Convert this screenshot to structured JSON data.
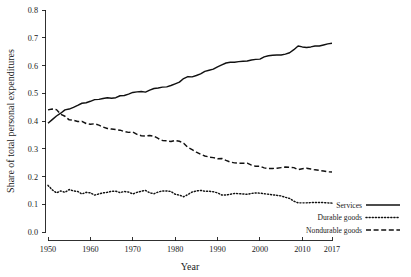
{
  "chart_data": {
    "type": "line",
    "title": "",
    "xlabel": "Year",
    "ylabel": "Share of total personal expenditures",
    "xlim": [
      1950,
      2017
    ],
    "ylim": [
      0.0,
      0.8
    ],
    "grid": false,
    "legend_position": "bottom-right",
    "xticks": [
      "1950",
      "1960",
      "1970",
      "1980",
      "1990",
      "2000",
      "2010",
      "2017"
    ],
    "xtick_values": [
      1950,
      1960,
      1970,
      1980,
      1990,
      2000,
      2010,
      2017
    ],
    "yticks": [
      "0.0",
      "0.1",
      "0.2",
      "0.3",
      "0.4",
      "0.5",
      "0.6",
      "0.7",
      "0.8"
    ],
    "ytick_values": [
      0.0,
      0.1,
      0.2,
      0.3,
      0.4,
      0.5,
      0.6,
      0.7,
      0.8
    ],
    "x": [
      1950,
      1951,
      1952,
      1953,
      1954,
      1955,
      1956,
      1957,
      1958,
      1959,
      1960,
      1961,
      1962,
      1963,
      1964,
      1965,
      1966,
      1967,
      1968,
      1969,
      1970,
      1971,
      1972,
      1973,
      1974,
      1975,
      1976,
      1977,
      1978,
      1979,
      1980,
      1981,
      1982,
      1983,
      1984,
      1985,
      1986,
      1987,
      1988,
      1989,
      1990,
      1991,
      1992,
      1993,
      1994,
      1995,
      1996,
      1997,
      1998,
      1999,
      2000,
      2001,
      2002,
      2003,
      2004,
      2005,
      2006,
      2007,
      2008,
      2009,
      2010,
      2011,
      2012,
      2013,
      2014,
      2015,
      2016,
      2017
    ],
    "series": [
      {
        "name": "Services",
        "style": "solid",
        "values": [
          0.392,
          0.405,
          0.418,
          0.428,
          0.44,
          0.443,
          0.449,
          0.456,
          0.464,
          0.466,
          0.471,
          0.477,
          0.478,
          0.481,
          0.484,
          0.482,
          0.484,
          0.491,
          0.492,
          0.497,
          0.503,
          0.505,
          0.506,
          0.504,
          0.511,
          0.517,
          0.519,
          0.522,
          0.523,
          0.528,
          0.534,
          0.54,
          0.553,
          0.56,
          0.559,
          0.564,
          0.57,
          0.579,
          0.583,
          0.587,
          0.595,
          0.602,
          0.609,
          0.612,
          0.612,
          0.614,
          0.615,
          0.616,
          0.62,
          0.622,
          0.623,
          0.631,
          0.635,
          0.637,
          0.638,
          0.638,
          0.641,
          0.646,
          0.657,
          0.67,
          0.667,
          0.665,
          0.667,
          0.67,
          0.67,
          0.674,
          0.678,
          0.68
        ]
      },
      {
        "name": "Durable goods",
        "style": "dotted",
        "values": [
          0.168,
          0.152,
          0.141,
          0.148,
          0.143,
          0.153,
          0.148,
          0.146,
          0.137,
          0.143,
          0.141,
          0.133,
          0.137,
          0.141,
          0.143,
          0.147,
          0.147,
          0.142,
          0.146,
          0.144,
          0.137,
          0.143,
          0.147,
          0.15,
          0.141,
          0.138,
          0.144,
          0.148,
          0.148,
          0.146,
          0.136,
          0.133,
          0.127,
          0.135,
          0.144,
          0.148,
          0.15,
          0.147,
          0.147,
          0.145,
          0.141,
          0.133,
          0.133,
          0.136,
          0.139,
          0.138,
          0.137,
          0.136,
          0.139,
          0.141,
          0.14,
          0.138,
          0.136,
          0.134,
          0.132,
          0.13,
          0.125,
          0.121,
          0.111,
          0.105,
          0.105,
          0.105,
          0.106,
          0.106,
          0.106,
          0.106,
          0.105,
          0.104
        ]
      },
      {
        "name": "Nondurable goods",
        "style": "dashed",
        "values": [
          0.44,
          0.443,
          0.441,
          0.424,
          0.417,
          0.404,
          0.403,
          0.398,
          0.399,
          0.391,
          0.388,
          0.39,
          0.385,
          0.378,
          0.373,
          0.371,
          0.369,
          0.367,
          0.362,
          0.359,
          0.36,
          0.352,
          0.347,
          0.346,
          0.348,
          0.345,
          0.337,
          0.33,
          0.329,
          0.326,
          0.33,
          0.327,
          0.32,
          0.305,
          0.297,
          0.288,
          0.28,
          0.274,
          0.27,
          0.268,
          0.264,
          0.265,
          0.258,
          0.252,
          0.249,
          0.248,
          0.248,
          0.248,
          0.241,
          0.237,
          0.237,
          0.231,
          0.229,
          0.229,
          0.23,
          0.232,
          0.234,
          0.233,
          0.232,
          0.225,
          0.228,
          0.23,
          0.227,
          0.224,
          0.222,
          0.22,
          0.217,
          0.216
        ]
      }
    ]
  }
}
